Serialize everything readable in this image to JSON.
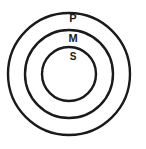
{
  "diagram": {
    "type": "concentric-circles",
    "background_color": "#ffffff",
    "stroke_color": "#1a1a1a",
    "label_color": "#1a1a1a",
    "center": {
      "x": 69,
      "y": 74
    },
    "rings": [
      {
        "id": "outer",
        "label": "P",
        "radius": 61,
        "stroke_width": 2.4,
        "label_x": 73,
        "label_y": 19,
        "label_font_size": 11
      },
      {
        "id": "middle",
        "label": "M",
        "radius": 44,
        "stroke_width": 2.4,
        "label_x": 73,
        "label_y": 39,
        "label_font_size": 11
      },
      {
        "id": "inner",
        "label": "S",
        "radius": 27,
        "stroke_width": 2.4,
        "label_x": 73,
        "label_y": 57,
        "label_font_size": 10
      }
    ]
  }
}
